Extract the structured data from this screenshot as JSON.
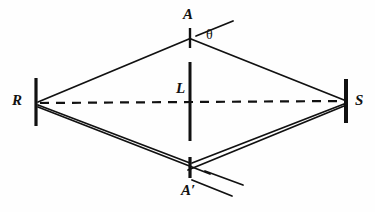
{
  "figure": {
    "type": "geometric-optics-diagram",
    "background_color": "#fefefe",
    "stroke_color": "#111111",
    "width": 375,
    "height": 212
  },
  "labels": {
    "source_right": "S",
    "source_left": "R",
    "aperture_top": "A",
    "aperture_bottom": "A′",
    "barrier": "L",
    "angle": "θ"
  },
  "points": {
    "R": {
      "x": 36,
      "y": 103
    },
    "S": {
      "x": 345,
      "y": 101
    },
    "A": {
      "x": 190,
      "y": 38
    },
    "Aprime": {
      "x": 190,
      "y": 167
    }
  },
  "barriers": [
    {
      "name": "barrier-R",
      "x": 36,
      "y1": 78,
      "y2": 126,
      "width": 3
    },
    {
      "name": "barrier-S",
      "x": 346,
      "y1": 79,
      "y2": 123,
      "width": 4
    },
    {
      "name": "barrier-L",
      "x": 190,
      "y1": 62,
      "y2": 141,
      "width": 3
    },
    {
      "name": "tick-A",
      "x": 190,
      "y1": 28,
      "y2": 48,
      "width": 2
    },
    {
      "name": "tick-Aprime",
      "x": 190,
      "y1": 157,
      "y2": 178,
      "width": 3
    }
  ],
  "segments": [
    {
      "name": "ray-R-to-A",
      "from": "R",
      "to": "A"
    },
    {
      "name": "ray-A-to-S",
      "from": "A",
      "to": "S"
    },
    {
      "name": "ray-R-to-Aprime",
      "from": "R",
      "to": "Aprime"
    },
    {
      "name": "ray-Aprime-to-S",
      "from": "Aprime",
      "to": "S"
    },
    {
      "name": "ray-R-to-lower",
      "from": "R",
      "to": "lower-right"
    },
    {
      "name": "ray-S-to-lower",
      "from": "S",
      "to": "lower-left"
    }
  ],
  "dashed_axis": {
    "name": "axis-R-to-S",
    "from": "R",
    "to": "S",
    "dash_length": 9,
    "gap_length": 7
  },
  "extension_rays": [
    {
      "name": "extension-ray-above-A",
      "note": "continues up-right past A"
    },
    {
      "name": "extension-ray-below-Aprime-upper",
      "note": "continues down-right past A′"
    },
    {
      "name": "extension-ray-below-Aprime-lower",
      "note": "continues down-right past A′"
    }
  ]
}
